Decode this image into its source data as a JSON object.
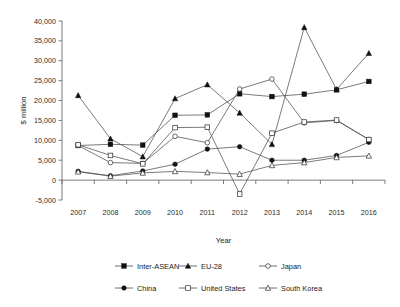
{
  "chart_data": {
    "type": "line",
    "title": "",
    "xlabel": "Year",
    "ylabel": "$ million",
    "categories": [
      2007,
      2008,
      2009,
      2010,
      2011,
      2012,
      2013,
      2014,
      2015,
      2016
    ],
    "x_tick_labels": [
      "2007",
      "2008",
      "2009",
      "2010",
      "2011",
      "2012",
      "2013",
      "2014",
      "2015",
      "2016"
    ],
    "y_tick_labels": [
      "-5,000",
      "0",
      "5,000",
      "10,000",
      "15,000",
      "20,000",
      "25,000",
      "30,000",
      "35,000",
      "40,000"
    ],
    "y_tick_values": [
      -5000,
      0,
      5000,
      10000,
      15000,
      20000,
      25000,
      30000,
      35000,
      40000
    ],
    "ylim": [
      -5000,
      40000
    ],
    "grid": false,
    "legend_position": "bottom",
    "series": [
      {
        "name": "Inter-ASEAN",
        "marker": "filled-square",
        "values": [
          8700,
          9000,
          8800,
          16300,
          16400,
          21700,
          21000,
          21600,
          22700,
          24800
        ]
      },
      {
        "name": "EU-28",
        "marker": "filled-triangle",
        "values": [
          21300,
          10400,
          5900,
          20500,
          24000,
          16900,
          9000,
          38400,
          22800,
          31900
        ]
      },
      {
        "name": "Japan",
        "marker": "open-circle",
        "values": [
          8700,
          4400,
          4200,
          11000,
          9400,
          22900,
          25400,
          14400,
          15000,
          10200
        ]
      },
      {
        "name": "China",
        "marker": "filled-circle",
        "values": [
          2200,
          1100,
          2300,
          4000,
          7800,
          8400,
          5000,
          5000,
          6200,
          9500
        ]
      },
      {
        "name": "United States",
        "marker": "open-square",
        "values": [
          8900,
          6200,
          4100,
          13200,
          13300,
          -3500,
          11800,
          14600,
          15100,
          10200
        ]
      },
      {
        "name": "South Korea",
        "marker": "open-triangle",
        "values": [
          2100,
          1000,
          1800,
          2200,
          1900,
          1500,
          3700,
          4400,
          5700,
          6100
        ]
      }
    ]
  },
  "legend": {
    "row1": [
      "Inter-ASEAN",
      "EU-28",
      "Japan"
    ],
    "row2": [
      "China",
      "United States",
      "South Korea"
    ]
  }
}
